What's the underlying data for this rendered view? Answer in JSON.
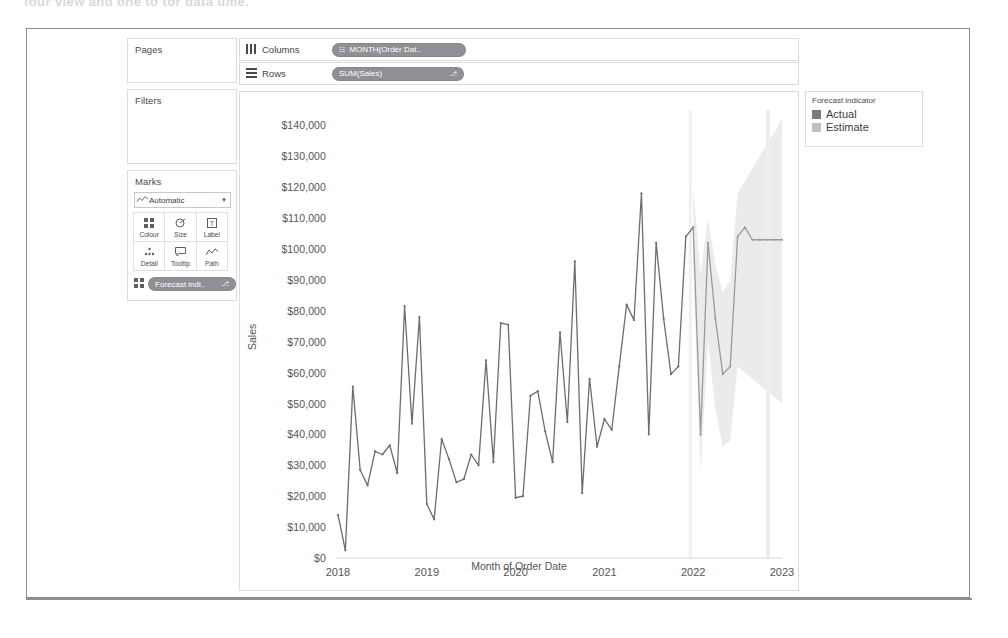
{
  "top_cut_text": "four view and one to tor data  ume.",
  "shelves": {
    "pages_label": "Pages",
    "filters_label": "Filters",
    "marks_label": "Marks",
    "columns_label": "Columns",
    "rows_label": "Rows",
    "columns_icon": "columns-icon",
    "rows_icon": "rows-icon",
    "columns_pill": "MONTH(Order Dat..",
    "columns_pill_prefix": "☷",
    "rows_pill": "SUM(Sales)",
    "rows_pill_suffix": "⎇"
  },
  "marks": {
    "type_label": "Automatic",
    "type_icon": "line-chart-icon",
    "caret": "▼",
    "buttons": [
      {
        "label": "Colour",
        "icon": "colour-icon",
        "glyph": "∷"
      },
      {
        "label": "Size",
        "icon": "size-icon",
        "glyph": "◔"
      },
      {
        "label": "Label",
        "icon": "label-icon",
        "glyph": "Ⓓ"
      },
      {
        "label": "Detail",
        "icon": "detail-icon",
        "glyph": "∵"
      },
      {
        "label": "Tooltip",
        "icon": "tooltip-icon",
        "glyph": "⬜"
      },
      {
        "label": "Path",
        "icon": "path-icon",
        "glyph": "∿"
      }
    ],
    "pill_label": "Forecast indi..",
    "pill_suffix": "⎇",
    "pill_icon": "colour-icon"
  },
  "legend": {
    "title": "Forecast indicator",
    "items": [
      {
        "label": "Actual",
        "color": "#7a7a7a"
      },
      {
        "label": "Estimate",
        "color": "#c0c0c0"
      }
    ]
  },
  "chart_data": {
    "type": "line",
    "title": "",
    "xlabel": "Month of Order Date",
    "ylabel": "Sales",
    "ylim": [
      0,
      145000
    ],
    "yticks": [
      0,
      10000,
      20000,
      30000,
      40000,
      50000,
      60000,
      70000,
      80000,
      90000,
      100000,
      110000,
      120000,
      130000,
      140000
    ],
    "ytick_labels": [
      "$0",
      "$10,000",
      "$20,000",
      "$30,000",
      "$40,000",
      "$50,000",
      "$60,000",
      "$70,000",
      "$80,000",
      "$90,000",
      "$100,000",
      "$110,000",
      "$120,000",
      "$130,000",
      "$140,000"
    ],
    "xticks": [
      2018,
      2019,
      2020,
      2021,
      2022,
      2023
    ],
    "xtick_labels": [
      "2018",
      "2019",
      "2020",
      "2021",
      "2022",
      "2023"
    ],
    "xlim": [
      2018.0,
      2023.0
    ],
    "grid": false,
    "legend_position": "right",
    "line_color": "#6d6d6d",
    "band_color": "#e8e8e8",
    "series": [
      {
        "name": "Actual",
        "color": "#6d6d6d",
        "x": [
          2018.0,
          2018.083,
          2018.167,
          2018.25,
          2018.333,
          2018.417,
          2018.5,
          2018.583,
          2018.667,
          2018.75,
          2018.833,
          2018.917,
          2019.0,
          2019.083,
          2019.167,
          2019.25,
          2019.333,
          2019.417,
          2019.5,
          2019.583,
          2019.667,
          2019.75,
          2019.833,
          2019.917,
          2020.0,
          2020.083,
          2020.167,
          2020.25,
          2020.333,
          2020.417,
          2020.5,
          2020.583,
          2020.667,
          2020.75,
          2020.833,
          2020.917,
          2021.0,
          2021.083,
          2021.167,
          2021.25,
          2021.333,
          2021.417,
          2021.5,
          2021.583,
          2021.667,
          2021.75,
          2021.833,
          2021.917,
          2022.0
        ],
        "values": [
          14000,
          2500,
          55500,
          28500,
          23500,
          34500,
          33500,
          36500,
          27500,
          81500,
          43500,
          78000,
          17500,
          12500,
          38500,
          32000,
          24500,
          25500,
          33500,
          30000,
          64000,
          31000,
          76000,
          75500,
          19500,
          20000,
          52500,
          54000,
          41000,
          31000,
          73000,
          44000,
          96000,
          21000,
          58000,
          36000,
          45000,
          41500,
          62000,
          82000,
          77000,
          118000,
          40000,
          102000,
          77500,
          59500,
          62000,
          104000,
          107000
        ]
      },
      {
        "name": "Estimate",
        "color": "#9a9a9a",
        "x": [
          2022.0,
          2022.083,
          2022.167,
          2022.25,
          2022.333,
          2022.417,
          2022.5,
          2022.583,
          2022.667,
          2022.75,
          2022.833,
          2022.917,
          2023.0
        ],
        "values": [
          107000,
          40000,
          102000,
          77500,
          59500,
          62000,
          104000,
          107000,
          103000,
          103000,
          103000,
          103000,
          103000
        ],
        "band_lower": [
          95000,
          28000,
          70000,
          48000,
          36000,
          38000,
          62000,
          60000,
          58000,
          56000,
          54000,
          52000,
          50000
        ],
        "band_upper": [
          120000,
          92000,
          110000,
          95000,
          86000,
          90000,
          118000,
          122000,
          126000,
          130000,
          134000,
          138000,
          142000
        ]
      }
    ]
  }
}
